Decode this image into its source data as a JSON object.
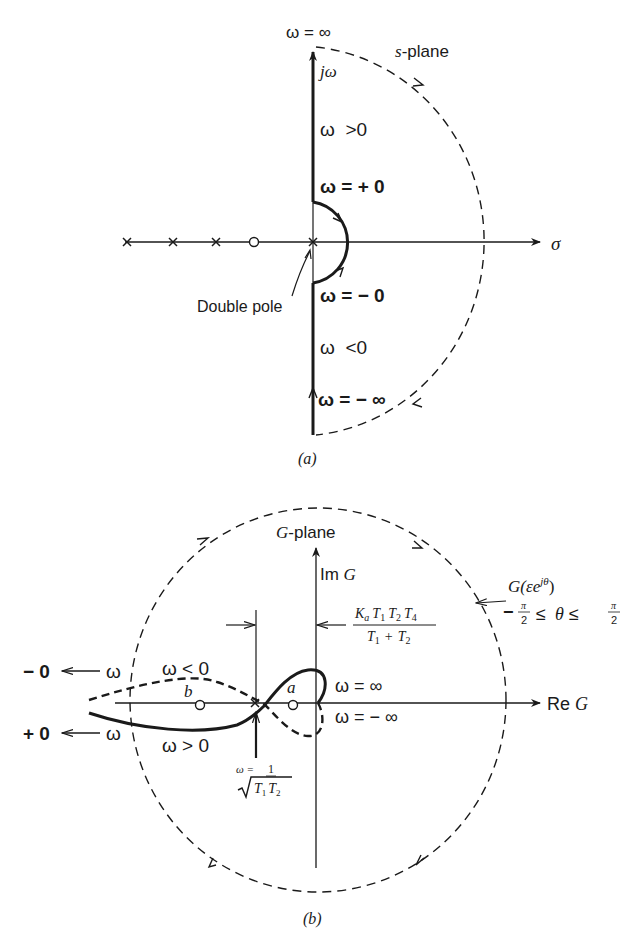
{
  "panel_a": {
    "title": "s-plane",
    "title_italic_part": "s",
    "title_rest": "-plane",
    "vertical_axis_label": "jω",
    "horizontal_axis_label": "σ",
    "top_label": "ω = ∞",
    "labels": {
      "omega_positive": "ω  >0",
      "omega_plus_zero": "ω = + 0",
      "omega_minus_zero": "ω = − 0",
      "omega_negative": "ω  <0",
      "omega_minus_inf": "ω = − ∞",
      "double_pole": "Double pole"
    },
    "poles_x": [
      127,
      173,
      216
    ],
    "zero_x": 254,
    "double_pole_x": 313,
    "caption": "(a)"
  },
  "panel_b": {
    "title": "G-plane",
    "title_italic_part": "G",
    "title_rest": "-plane",
    "vertical_axis_label_prefix": "Im ",
    "vertical_axis_label_var": "G",
    "horizontal_axis_label_prefix": "Re ",
    "horizontal_axis_label_var": "G",
    "gain_expression_numerator": "KaT1T2T4",
    "gain_expression": {
      "num": [
        "K",
        "a",
        "T",
        "1",
        "T",
        "2",
        "T",
        "4"
      ],
      "den": [
        "T",
        "1",
        "+",
        "T",
        "2"
      ]
    },
    "circle_label": "G(εe^{jθ})",
    "circle_label_parts": {
      "prefix": "G(εe",
      "sup": "jθ",
      "suffix": ")"
    },
    "theta_range": "−π/2 ≤ θ ≤ π/2",
    "theta_parts": {
      "minus": "−",
      "num": "π",
      "den": "2",
      "le": "≤",
      "theta": "θ"
    },
    "labels": {
      "minus_zero": "− 0",
      "plus_zero": "+ 0",
      "omega_left_top": "ω",
      "omega_left_bottom": "ω",
      "omega_less_zero": "ω < 0",
      "omega_greater_zero": "ω > 0",
      "omega_inf": "ω = ∞",
      "omega_minus_inf": "ω = − ∞",
      "point_a": "a",
      "point_b": "b",
      "crossover_omega": "ω =",
      "crossover_num": "1",
      "crossover_den": "T1T2"
    },
    "caption": "(b)"
  }
}
